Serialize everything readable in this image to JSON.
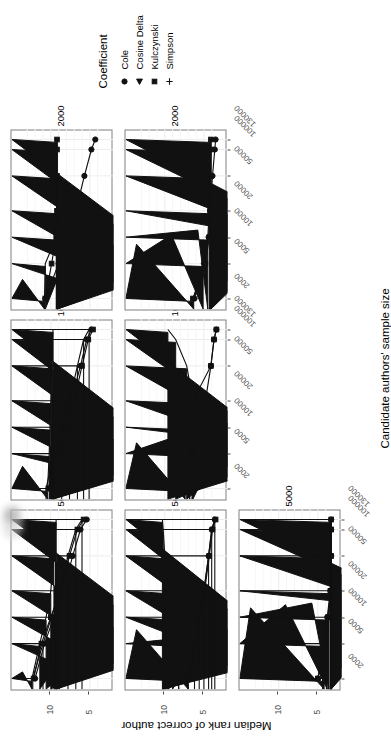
{
  "figure": {
    "xlabel": "Candidate authors' sample size",
    "ylabel": "Median rank of correct author"
  },
  "legend": {
    "title": "Coefficient",
    "items": [
      {
        "label": "Cole",
        "marker": "circle-marker"
      },
      {
        "label": "Cosine Delta",
        "marker": "triangle-marker"
      },
      {
        "label": "Kulczynski",
        "marker": "square-marker"
      },
      {
        "label": "Simpson",
        "marker": "plus-marker"
      }
    ]
  },
  "chart_data": {
    "type": "line",
    "title": "",
    "xlabel": "Candidate authors' sample size",
    "ylabel": "Median rank of correct author",
    "x": [
      2000,
      5000,
      10000,
      20000,
      50000,
      100000,
      130000
    ],
    "xticklabels": [
      "2000",
      "5000",
      "10000",
      "20000",
      "50000",
      "100000",
      "130000"
    ],
    "xscale": "log",
    "yticklabels": [
      "5",
      "10"
    ],
    "yticks": [
      5,
      10
    ],
    "ylim": [
      3,
      14
    ],
    "grid": true,
    "legend_position": "right",
    "facet_labels": [
      "500",
      "1000",
      "2000",
      "5000"
    ],
    "panels": [
      {
        "facet": "500",
        "row": 1,
        "col": 1,
        "series": [
          {
            "name": "Cole",
            "marker": "circle-marker",
            "values": [
              12.0,
              10.8,
              9.6,
              8.4,
              7.2,
              6.2,
              5.4
            ]
          },
          {
            "name": "Cosine Delta",
            "marker": "triangle-marker",
            "values": [
              12.4,
              11.4,
              10.6,
              10.0,
              9.6,
              9.4,
              9.3
            ]
          },
          {
            "name": "Kulczynski",
            "marker": "square-marker",
            "values": [
              12.2,
              11.2,
              10.0,
              8.8,
              7.6,
              6.6,
              5.8
            ]
          },
          {
            "name": "Simpson",
            "marker": "plus-marker",
            "values": [
              12.3,
              11.0,
              9.9,
              8.9,
              7.8,
              6.8,
              6.0
            ]
          }
        ]
      },
      {
        "facet": "1000",
        "row": 1,
        "col": 2,
        "series": [
          {
            "name": "Cole",
            "marker": "circle-marker",
            "values": [
              10.2,
              9.4,
              8.3,
              7.4,
              6.2,
              5.4,
              4.8
            ]
          },
          {
            "name": "Cosine Delta",
            "marker": "triangle-marker",
            "values": [
              10.4,
              10.2,
              10.1,
              10.0,
              9.9,
              9.8,
              9.7
            ]
          },
          {
            "name": "Kulczynski",
            "marker": "square-marker",
            "values": [
              10.3,
              9.2,
              8.1,
              7.0,
              6.0,
              5.2,
              4.6
            ]
          },
          {
            "name": "Simpson",
            "marker": "plus-marker",
            "values": [
              10.6,
              9.6,
              8.6,
              7.6,
              6.6,
              5.8,
              5.1
            ]
          }
        ]
      },
      {
        "facet": "2000",
        "row": 1,
        "col": 3,
        "series": [
          {
            "name": "Cole",
            "marker": "circle-marker",
            "values": [
              10.7,
              9.0,
              7.8,
              6.8,
              5.7,
              4.8,
              4.3
            ]
          },
          {
            "name": "Cosine Delta",
            "marker": "triangle-marker",
            "values": [
              10.8,
              10.7,
              9.3,
              9.2,
              9.2,
              9.2,
              9.2
            ]
          },
          {
            "name": "Kulczynski",
            "marker": "square-marker",
            "values": [
              10.7,
              9.9,
              9.3,
              9.2,
              9.2,
              9.2,
              9.2
            ]
          }
        ]
      },
      {
        "facet": "500",
        "row": 2,
        "col": 1,
        "series": [
          {
            "name": "Cole",
            "marker": "circle-marker",
            "values": [
              7.0,
              6.2,
              5.6,
              5.0,
              4.4,
              4.0,
              3.6
            ]
          },
          {
            "name": "Cosine Delta",
            "marker": "triangle-marker",
            "values": [
              7.0,
              8.2,
              9.0,
              9.6,
              10.0,
              10.2,
              10.3
            ]
          },
          {
            "name": "Kulczynski",
            "marker": "square-marker",
            "values": [
              6.9,
              6.1,
              5.5,
              4.9,
              4.3,
              3.9,
              3.5
            ]
          },
          {
            "name": "Simpson",
            "marker": "plus-marker",
            "values": [
              7.0,
              6.2,
              5.6,
              5.0,
              4.4,
              4.0,
              3.6
            ]
          }
        ]
      },
      {
        "facet": "1000",
        "row": 2,
        "col": 2,
        "series": [
          {
            "name": "Cole",
            "marker": "circle-marker",
            "values": [
              7.2,
              6.4,
              5.6,
              4.8,
              4.1,
              3.7,
              3.4
            ]
          },
          {
            "name": "Cosine Delta",
            "marker": "triangle-marker",
            "values": [
              7.4,
              6.8,
              6.5,
              6.4,
              7.2,
              8.6,
              9.6
            ]
          },
          {
            "name": "Kulczynski",
            "marker": "square-marker",
            "values": [
              7.3,
              6.5,
              6.4,
              6.4,
              4.1,
              3.7,
              3.4
            ]
          }
        ]
      },
      {
        "facet": "2000",
        "row": 2,
        "col": 3,
        "series": [
          {
            "name": "Cole",
            "marker": "circle-marker",
            "values": [
              6.2,
              5.0,
              4.4,
              4.2,
              3.9,
              3.6,
              3.5
            ]
          },
          {
            "name": "Cosine Delta",
            "marker": "triangle-marker",
            "values": [
              6.3,
              5.1,
              4.5,
              4.3,
              4.2,
              4.1,
              4.1
            ]
          },
          {
            "name": "Kulczynski",
            "marker": "square-marker",
            "values": [
              6.4,
              4.8,
              4.3,
              4.2,
              4.1,
              4.1,
              4.1
            ]
          }
        ]
      },
      {
        "facet": "5000",
        "row": 3,
        "col": 1,
        "series": [
          {
            "name": "Cole",
            "marker": "circle-marker",
            "values": [
              5.0,
              4.2,
              3.8,
              3.4,
              3.3,
              3.3,
              3.3
            ]
          },
          {
            "name": "Cosine Delta",
            "marker": "triangle-marker",
            "values": [
              4.2,
              3.8,
              3.6,
              3.4,
              3.3,
              3.3,
              3.3
            ]
          },
          {
            "name": "Kulczynski",
            "marker": "square-marker",
            "values": [
              5.0,
              4.1,
              3.7,
              3.4,
              3.3,
              3.3,
              3.3
            ]
          },
          {
            "name": "Simpson",
            "marker": "plus-marker",
            "values": [
              4.4,
              3.9,
              3.6,
              3.4,
              3.3,
              3.3,
              3.3
            ]
          }
        ]
      }
    ]
  }
}
